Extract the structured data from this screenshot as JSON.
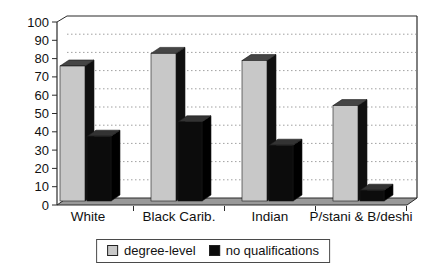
{
  "chart_data": {
    "type": "bar",
    "projection": "3d-clustered",
    "title": "",
    "categories": [
      "White",
      "Black Carib.",
      "Indian",
      "P/stani & B/deshi"
    ],
    "series": [
      {
        "name": "degree-level",
        "color_front": "#c8c8c8",
        "color_top": "#454545",
        "color_side": "#101010",
        "values": [
          75,
          82,
          78,
          53
        ]
      },
      {
        "name": "no qualifications",
        "color_front": "#0c0c0c",
        "color_top": "#333333",
        "color_side": "#000000",
        "values": [
          36,
          44,
          31,
          6
        ]
      }
    ],
    "xlabel": "",
    "ylabel": "",
    "ylim": [
      0,
      100
    ],
    "yticks": [
      0,
      10,
      20,
      30,
      40,
      50,
      60,
      70,
      80,
      90,
      100
    ],
    "grid": "horizontal-dotted",
    "legend_position": "bottom-center",
    "colors": {
      "wall": "#ffffff",
      "floor": "#999999",
      "gridline": "#a0a0a0",
      "axis_line": "#2b2b2b",
      "text": "#111111"
    }
  }
}
